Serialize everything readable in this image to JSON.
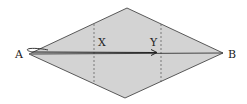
{
  "diagram": {
    "shape": "rhombus",
    "fill_color": "#d3d3d3",
    "stroke_color": "#333333",
    "vertices": {
      "left": {
        "label": "A",
        "x": 29,
        "y": 54
      },
      "right": {
        "label": "B",
        "x": 223,
        "y": 53
      },
      "top": {
        "x": 127,
        "y": 8
      },
      "bottom": {
        "x": 125,
        "y": 98
      }
    },
    "labels": {
      "a": "A",
      "b": "B",
      "x": "X",
      "y": "Y"
    },
    "dashed_lines": [
      {
        "label": "X",
        "x": 94
      },
      {
        "label": "Y",
        "x": 161
      }
    ],
    "arrow": {
      "from": "A",
      "to": "Y"
    }
  }
}
